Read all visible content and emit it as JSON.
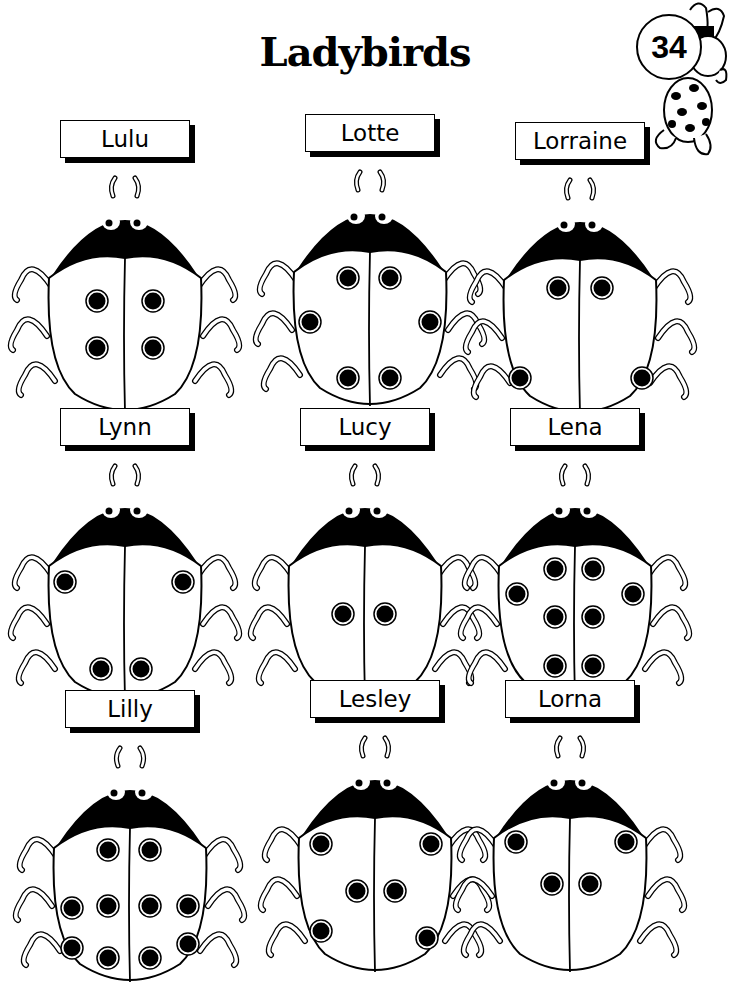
{
  "page": {
    "title": "Ladybirds",
    "page_number": "34",
    "mascot": "rabbit-with-spots"
  },
  "colors": {
    "ink": "#000000",
    "paper": "#ffffff"
  },
  "ladybirds": [
    {
      "name": "Lulu",
      "spots": 4
    },
    {
      "name": "Lotte",
      "spots": 6
    },
    {
      "name": "Lorraine",
      "spots": 4
    },
    {
      "name": "Lynn",
      "spots": 4
    },
    {
      "name": "Lucy",
      "spots": 2
    },
    {
      "name": "Lena",
      "spots": 8
    },
    {
      "name": "Lilly",
      "spots": 10
    },
    {
      "name": "Lesley",
      "spots": 6
    },
    {
      "name": "Lorna",
      "spots": 4
    }
  ]
}
